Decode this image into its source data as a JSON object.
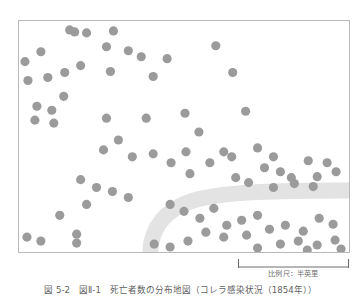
{
  "figure": {
    "caption": "図 5-2　図Ⅱ-1　死亡者数の分布地図（コレラ感染状況（1854年））",
    "frame": {
      "x": 18,
      "y": 20,
      "width": 332,
      "height": 233,
      "border_color": "#b9b9b9",
      "background_color": "#ffffff"
    }
  },
  "scale": {
    "label": "比例尺：半英里",
    "bar_color": "#6e6e6e",
    "bar_length_px": 110
  },
  "chart_data": {
    "type": "scatter",
    "title": "",
    "xlabel": "",
    "ylabel": "",
    "grid": false,
    "legend": null,
    "xlim": [
      0,
      332
    ],
    "ylim": [
      0,
      233
    ],
    "marker": {
      "shape": "circle",
      "color": "#9b9b9b",
      "radius": 4.6,
      "count": 86
    },
    "annotations": [
      {
        "name": "road-band",
        "type": "curved-band",
        "color": "#e3e3e3",
        "stroke_width": 16,
        "path": "M 132 233 C 133 210, 146 190, 176 181 C 206 172, 262 171, 332 171"
      }
    ],
    "points": [
      [
        51,
        9
      ],
      [
        56,
        11
      ],
      [
        68,
        12
      ],
      [
        95,
        10
      ],
      [
        88,
        26
      ],
      [
        22,
        31
      ],
      [
        110,
        30
      ],
      [
        6,
        41
      ],
      [
        46,
        52
      ],
      [
        123,
        36
      ],
      [
        92,
        51
      ],
      [
        149,
        38
      ],
      [
        9,
        60
      ],
      [
        29,
        57
      ],
      [
        45,
        76
      ],
      [
        62,
        45
      ],
      [
        135,
        56
      ],
      [
        18,
        86
      ],
      [
        33,
        90
      ],
      [
        16,
        100
      ],
      [
        35,
        103
      ],
      [
        198,
        25
      ],
      [
        215,
        52
      ],
      [
        167,
        93
      ],
      [
        228,
        91
      ],
      [
        88,
        98
      ],
      [
        128,
        98
      ],
      [
        181,
        112
      ],
      [
        100,
        120
      ],
      [
        135,
        134
      ],
      [
        85,
        130
      ],
      [
        114,
        137
      ],
      [
        168,
        132
      ],
      [
        206,
        132
      ],
      [
        153,
        143
      ],
      [
        192,
        143
      ],
      [
        240,
        128
      ],
      [
        214,
        137
      ],
      [
        256,
        137
      ],
      [
        172,
        154
      ],
      [
        218,
        158
      ],
      [
        247,
        148
      ],
      [
        263,
        152
      ],
      [
        291,
        141
      ],
      [
        310,
        143
      ],
      [
        274,
        158
      ],
      [
        300,
        157
      ],
      [
        319,
        152
      ],
      [
        231,
        163
      ],
      [
        256,
        168
      ],
      [
        277,
        164
      ],
      [
        296,
        167
      ],
      [
        62,
        160
      ],
      [
        78,
        168
      ],
      [
        94,
        172
      ],
      [
        110,
        178
      ],
      [
        68,
        185
      ],
      [
        41,
        196
      ],
      [
        8,
        218
      ],
      [
        22,
        222
      ],
      [
        58,
        215
      ],
      [
        58,
        224
      ],
      [
        152,
        185
      ],
      [
        166,
        192
      ],
      [
        182,
        199
      ],
      [
        196,
        189
      ],
      [
        209,
        206
      ],
      [
        224,
        201
      ],
      [
        240,
        196
      ],
      [
        188,
        213
      ],
      [
        206,
        218
      ],
      [
        229,
        216
      ],
      [
        252,
        210
      ],
      [
        268,
        206
      ],
      [
        286,
        212
      ],
      [
        302,
        199
      ],
      [
        316,
        205
      ],
      [
        263,
        225
      ],
      [
        281,
        222
      ],
      [
        300,
        226
      ],
      [
        318,
        221
      ],
      [
        136,
        225
      ],
      [
        152,
        228
      ],
      [
        170,
        222
      ],
      [
        240,
        229
      ],
      [
        290,
        231
      ],
      [
        324,
        230
      ]
    ]
  }
}
